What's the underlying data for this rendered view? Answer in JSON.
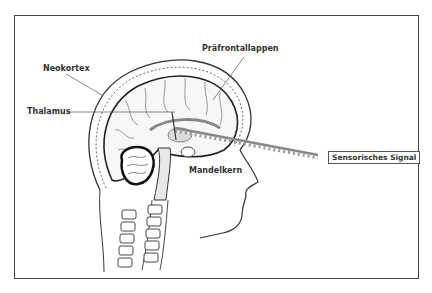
{
  "figure": {
    "labels": {
      "neokortex": "Neokortex",
      "thalamus": "Thalamus",
      "praefrontallappen": "Präfrontallappen",
      "mandelkern": "Mandelkern",
      "signal": "Sensorisches Signal"
    }
  }
}
